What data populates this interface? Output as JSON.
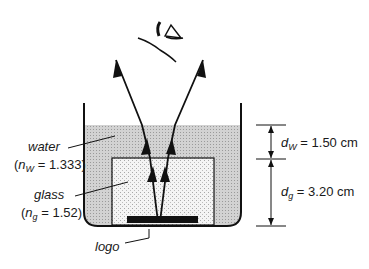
{
  "diagram": {
    "type": "optics-refraction",
    "labels": {
      "water": "water",
      "water_index_sym": "n",
      "water_index_sub": "W",
      "water_index_val": " = 1.333)",
      "glass": "glass",
      "glass_index_sym": "n",
      "glass_index_sub": "g",
      "glass_index_val": " = 1.52)",
      "logo": "logo",
      "dw_sym": "d",
      "dw_sub": "W",
      "dw_val": " = 1.50 cm",
      "dg_sym": "d",
      "dg_sub": "g",
      "dg_val": " = 3.20 cm",
      "open_paren": "("
    },
    "icons": [
      "eye-icon"
    ],
    "colors": {
      "line": "#111111",
      "water": "#c8c8c8",
      "glass": "#ececec"
    }
  }
}
